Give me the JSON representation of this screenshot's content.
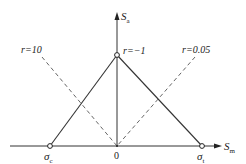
{
  "diagram": {
    "type": "Haigh diagram (limit stress line)",
    "axes": {
      "y": {
        "symbol": "S",
        "subscript": "a"
      },
      "x": {
        "symbol": "S",
        "subscript": "m"
      }
    },
    "points": {
      "apex": {
        "label": "r=−1"
      },
      "compressive": {
        "symbol": "σ",
        "subscript": "c"
      },
      "tensile": {
        "symbol": "σ",
        "subscript": "t"
      },
      "origin": {
        "label": "0"
      }
    },
    "rays": [
      {
        "label": "r=10",
        "style": "dashed"
      },
      {
        "label": "r=0.05",
        "style": "dashed"
      }
    ],
    "colors": {
      "line": "#333333",
      "dashed": "#555555",
      "text": "#222222",
      "background": "#ffffff"
    }
  }
}
